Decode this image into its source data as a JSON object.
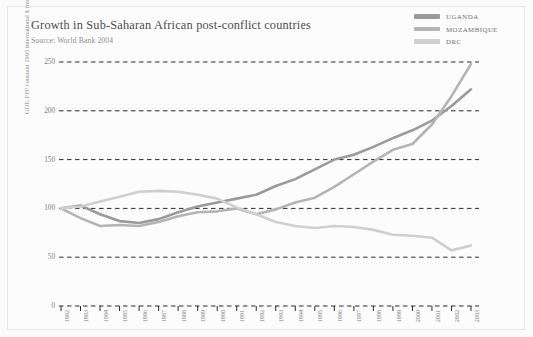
{
  "header": {
    "title": "Growth in Sub-Saharan African post-conflict countries",
    "source": "Source: World Bank 2004"
  },
  "legend": {
    "position": "top-right",
    "items": [
      {
        "label": "UGANDA",
        "color": "#9a9a9a"
      },
      {
        "label": "MOZAMBIQUE",
        "color": "#b4b4b4"
      },
      {
        "label": "DRC",
        "color": "#cfcfcf"
      }
    ]
  },
  "chart_data": {
    "type": "line",
    "title": "Growth in Sub-Saharan African post-conflict countries",
    "subtitle": "Source: World Bank 2004",
    "xlabel": "",
    "ylabel": "GDP, PPP constant 1995 international $ (rescaled to 1982=100)",
    "x": [
      1982,
      1983,
      1984,
      1985,
      1986,
      1987,
      1988,
      1989,
      1990,
      1991,
      1992,
      1993,
      1994,
      1995,
      1996,
      1997,
      1998,
      1999,
      2000,
      2001,
      2002,
      2003
    ],
    "categories": [
      "1982",
      "1983",
      "1984",
      "1985",
      "1986",
      "1987",
      "1988",
      "1989",
      "1990",
      "1991",
      "1992",
      "1993",
      "1994",
      "1995",
      "1996",
      "1997",
      "1998",
      "1999",
      "2000",
      "2001",
      "2002",
      "2003"
    ],
    "xlim": [
      1982,
      2003
    ],
    "ylim": [
      0,
      250
    ],
    "yticks": [
      0,
      50,
      100,
      150,
      200,
      250
    ],
    "grid": "horizontal-dashed",
    "series": [
      {
        "name": "UGANDA",
        "color": "#9a9a9a",
        "values": [
          100,
          103,
          94,
          87,
          85,
          89,
          96,
          102,
          106,
          110,
          114,
          123,
          130,
          140,
          150,
          155,
          163,
          172,
          180,
          190,
          205,
          222
        ]
      },
      {
        "name": "MOZAMBIQUE",
        "color": "#b4b4b4",
        "values": [
          100,
          90,
          82,
          83,
          82,
          86,
          92,
          96,
          97,
          100,
          94,
          99,
          106,
          111,
          122,
          135,
          148,
          160,
          166,
          186,
          215,
          248
        ]
      },
      {
        "name": "DRC",
        "color": "#cfcfcf",
        "values": [
          100,
          102,
          107,
          112,
          117,
          118,
          117,
          114,
          110,
          101,
          94,
          86,
          82,
          80,
          82,
          81,
          78,
          73,
          72,
          70,
          57,
          62
        ]
      }
    ]
  }
}
